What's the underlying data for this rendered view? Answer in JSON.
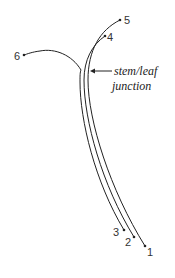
{
  "diagram": {
    "title": "",
    "annotation": {
      "line1": "stem/leaf",
      "line2": "junction"
    },
    "points": [
      {
        "id": "1",
        "label": "1"
      },
      {
        "id": "2",
        "label": "2"
      },
      {
        "id": "3",
        "label": "3"
      },
      {
        "id": "4",
        "label": "4"
      },
      {
        "id": "5",
        "label": "5"
      },
      {
        "id": "6",
        "label": "6"
      }
    ],
    "colors": {
      "line": "#222222",
      "text": "#333333",
      "background": "#ffffff"
    }
  }
}
